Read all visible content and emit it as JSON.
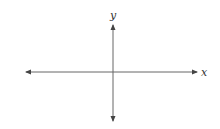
{
  "diagram": {
    "type": "coordinate-axes",
    "x_axis": {
      "label": "x",
      "direction": "bidirectional"
    },
    "y_axis": {
      "label": "y",
      "direction": "bidirectional"
    },
    "colors": {
      "axis": "#555555",
      "label": "#333333",
      "background": "#ffffff"
    }
  }
}
